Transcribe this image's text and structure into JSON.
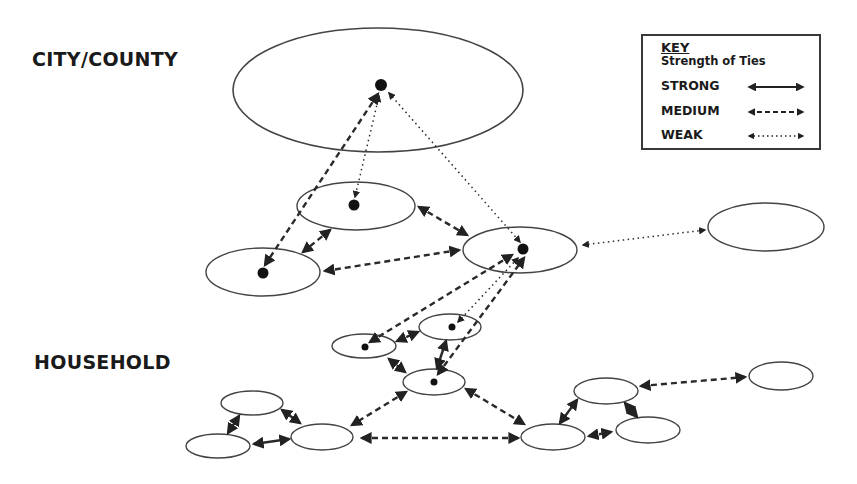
{
  "labels": {
    "top_level": "CITY/COUNTY",
    "bottom_level": "HOUSEHOLD"
  },
  "key": {
    "title": "KEY",
    "subtitle": "Strength of Ties",
    "entries": [
      {
        "label": "STRONG",
        "style": "solid"
      },
      {
        "label": "MEDIUM",
        "style": "dashed"
      },
      {
        "label": "WEAK",
        "style": "dotted"
      }
    ]
  },
  "colors": {
    "line": "#2a2a2a",
    "background": "#ffffff"
  },
  "nodes": [
    {
      "id": "city",
      "cx": 378,
      "cy": 90,
      "rx": 145,
      "ry": 62,
      "dot": [
        381,
        85
      ]
    },
    {
      "id": "mid-upper",
      "cx": 356,
      "cy": 206,
      "rx": 59,
      "ry": 24,
      "dot": [
        354,
        205
      ]
    },
    {
      "id": "mid-left",
      "cx": 263,
      "cy": 272,
      "rx": 57,
      "ry": 24,
      "dot": [
        263,
        273
      ]
    },
    {
      "id": "mid-center",
      "cx": 520,
      "cy": 250,
      "rx": 57,
      "ry": 23,
      "dot": [
        523,
        249
      ]
    },
    {
      "id": "mid-right",
      "cx": 766,
      "cy": 227,
      "rx": 58,
      "ry": 24,
      "dot": null
    },
    {
      "id": "hh-a",
      "cx": 364,
      "cy": 346,
      "rx": 32,
      "ry": 12,
      "dot": [
        365,
        347
      ]
    },
    {
      "id": "hh-b",
      "cx": 450,
      "cy": 327,
      "rx": 31,
      "ry": 13,
      "dot": [
        452,
        327
      ]
    },
    {
      "id": "hh-c",
      "cx": 434,
      "cy": 382,
      "rx": 31,
      "ry": 13,
      "dot": [
        434,
        382
      ]
    },
    {
      "id": "hh-d",
      "cx": 252,
      "cy": 403,
      "rx": 31,
      "ry": 12,
      "dot": null
    },
    {
      "id": "hh-e",
      "cx": 218,
      "cy": 446,
      "rx": 32,
      "ry": 12,
      "dot": null
    },
    {
      "id": "hh-f",
      "cx": 322,
      "cy": 437,
      "rx": 31,
      "ry": 13,
      "dot": null
    },
    {
      "id": "hh-g",
      "cx": 553,
      "cy": 437,
      "rx": 32,
      "ry": 13,
      "dot": null
    },
    {
      "id": "hh-h",
      "cx": 606,
      "cy": 391,
      "rx": 32,
      "ry": 13,
      "dot": null
    },
    {
      "id": "hh-i",
      "cx": 648,
      "cy": 430,
      "rx": 32,
      "ry": 13,
      "dot": null
    },
    {
      "id": "hh-j",
      "cx": 781,
      "cy": 376,
      "rx": 32,
      "ry": 14,
      "dot": null
    }
  ],
  "ties": [
    {
      "from": "city",
      "to": "mid-left",
      "strength": "medium",
      "x1": 378,
      "y1": 94,
      "x2": 265,
      "y2": 265
    },
    {
      "from": "city",
      "to": "mid-upper",
      "strength": "weak",
      "x1": 379,
      "y1": 96,
      "x2": 355,
      "y2": 197
    },
    {
      "from": "city",
      "to": "mid-center",
      "strength": "weak",
      "x1": 389,
      "y1": 93,
      "x2": 520,
      "y2": 242
    },
    {
      "from": "mid-upper",
      "to": "mid-left",
      "strength": "medium",
      "x1": 330,
      "y1": 230,
      "x2": 303,
      "y2": 252
    },
    {
      "from": "mid-upper",
      "to": "mid-center",
      "strength": "medium",
      "x1": 419,
      "y1": 207,
      "x2": 467,
      "y2": 235
    },
    {
      "from": "mid-left",
      "to": "mid-center",
      "strength": "medium",
      "x1": 325,
      "y1": 271,
      "x2": 459,
      "y2": 250
    },
    {
      "from": "mid-center",
      "to": "mid-right",
      "strength": "weak",
      "x1": 583,
      "y1": 245,
      "x2": 705,
      "y2": 230
    },
    {
      "from": "hh-a",
      "to": "mid-center",
      "strength": "medium",
      "x1": 370,
      "y1": 342,
      "x2": 512,
      "y2": 255
    },
    {
      "from": "hh-b",
      "to": "mid-center",
      "strength": "weak",
      "x1": 458,
      "y1": 322,
      "x2": 518,
      "y2": 258
    },
    {
      "from": "hh-c",
      "to": "mid-center",
      "strength": "medium",
      "x1": 438,
      "y1": 374,
      "x2": 524,
      "y2": 258
    },
    {
      "from": "hh-a",
      "to": "hh-b",
      "strength": "medium",
      "x1": 397,
      "y1": 341,
      "x2": 418,
      "y2": 332
    },
    {
      "from": "hh-a",
      "to": "hh-c",
      "strength": "medium",
      "x1": 389,
      "y1": 359,
      "x2": 405,
      "y2": 372
    },
    {
      "from": "hh-b",
      "to": "hh-c",
      "strength": "strong",
      "x1": 446,
      "y1": 341,
      "x2": 437,
      "y2": 368
    },
    {
      "from": "hh-c",
      "to": "hh-f",
      "strength": "medium",
      "x1": 406,
      "y1": 392,
      "x2": 352,
      "y2": 425
    },
    {
      "from": "hh-c",
      "to": "hh-g",
      "strength": "medium",
      "x1": 466,
      "y1": 389,
      "x2": 524,
      "y2": 424
    },
    {
      "from": "hh-d",
      "to": "hh-e",
      "strength": "strong",
      "x1": 239,
      "y1": 416,
      "x2": 228,
      "y2": 433
    },
    {
      "from": "hh-d",
      "to": "hh-f",
      "strength": "strong",
      "x1": 282,
      "y1": 410,
      "x2": 300,
      "y2": 423
    },
    {
      "from": "hh-e",
      "to": "hh-f",
      "strength": "strong",
      "x1": 254,
      "y1": 444,
      "x2": 289,
      "y2": 439
    },
    {
      "from": "hh-f",
      "to": "hh-g",
      "strength": "medium",
      "x1": 362,
      "y1": 438,
      "x2": 518,
      "y2": 438
    },
    {
      "from": "hh-g",
      "to": "hh-h",
      "strength": "strong",
      "x1": 560,
      "y1": 423,
      "x2": 577,
      "y2": 400
    },
    {
      "from": "hh-g",
      "to": "hh-i",
      "strength": "medium",
      "x1": 589,
      "y1": 436,
      "x2": 611,
      "y2": 432
    },
    {
      "from": "hh-h",
      "to": "hh-i",
      "strength": "strong",
      "x1": 625,
      "y1": 403,
      "x2": 637,
      "y2": 417
    },
    {
      "from": "hh-h",
      "to": "hh-j",
      "strength": "medium",
      "x1": 641,
      "y1": 386,
      "x2": 745,
      "y2": 377
    }
  ]
}
